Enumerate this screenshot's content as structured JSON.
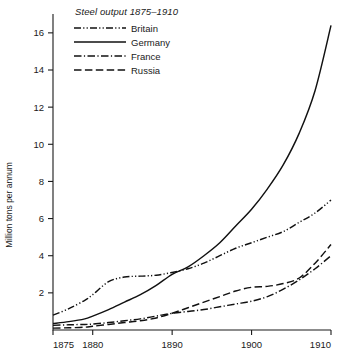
{
  "chart_data": {
    "type": "line",
    "title": "Steel output 1875–1910",
    "xlabel": "",
    "ylabel": "Million tons per annum",
    "xlim": [
      1875,
      1910
    ],
    "ylim": [
      0,
      16.8
    ],
    "grid": false,
    "legend_position": "top-left inside plot",
    "xticks": [
      1875,
      1880,
      1890,
      1900,
      1910
    ],
    "xtick_labels": [
      "1875",
      "1880",
      "1890",
      "1900",
      "1910"
    ],
    "yticks": [
      2,
      4,
      6,
      8,
      10,
      12,
      14,
      16
    ],
    "ytick_labels": [
      "2",
      "4",
      "6",
      "8",
      "10",
      "12",
      "14",
      "16"
    ],
    "series": [
      {
        "name": "Britain",
        "style": "dash-dot-dot",
        "x": [
          1875,
          1877,
          1879,
          1880,
          1882,
          1884,
          1886,
          1888,
          1890,
          1892,
          1894,
          1896,
          1898,
          1900,
          1902,
          1904,
          1906,
          1908,
          1910
        ],
        "values": [
          0.8,
          1.15,
          1.6,
          1.9,
          2.6,
          2.85,
          2.9,
          2.95,
          3.1,
          3.3,
          3.6,
          4.0,
          4.4,
          4.7,
          5.0,
          5.3,
          5.8,
          6.3,
          7.0
        ]
      },
      {
        "name": "Germany",
        "style": "solid",
        "x": [
          1875,
          1877,
          1879,
          1880,
          1882,
          1884,
          1886,
          1888,
          1890,
          1892,
          1894,
          1896,
          1898,
          1900,
          1902,
          1904,
          1906,
          1908,
          1910
        ],
        "values": [
          0.35,
          0.45,
          0.6,
          0.75,
          1.1,
          1.5,
          1.9,
          2.4,
          3.0,
          3.4,
          4.0,
          4.7,
          5.6,
          6.5,
          7.6,
          8.9,
          10.6,
          12.9,
          16.4
        ]
      },
      {
        "name": "France",
        "style": "dash-dot",
        "x": [
          1875,
          1877,
          1879,
          1880,
          1882,
          1884,
          1886,
          1888,
          1890,
          1892,
          1894,
          1896,
          1898,
          1900,
          1902,
          1904,
          1906,
          1908,
          1910
        ],
        "values": [
          0.25,
          0.28,
          0.3,
          0.32,
          0.4,
          0.5,
          0.6,
          0.75,
          0.9,
          1.0,
          1.1,
          1.25,
          1.4,
          1.55,
          1.8,
          2.2,
          2.7,
          3.3,
          4.0
        ]
      },
      {
        "name": "Russia",
        "style": "long-dash",
        "x": [
          1875,
          1877,
          1879,
          1880,
          1882,
          1884,
          1886,
          1888,
          1890,
          1892,
          1894,
          1896,
          1898,
          1900,
          1902,
          1904,
          1906,
          1908,
          1910
        ],
        "values": [
          0.1,
          0.12,
          0.15,
          0.2,
          0.3,
          0.4,
          0.5,
          0.65,
          0.9,
          1.2,
          1.5,
          1.8,
          2.1,
          2.3,
          2.35,
          2.5,
          2.8,
          3.6,
          4.6
        ]
      }
    ]
  },
  "legend": {
    "title": "Steel output 1875–1910",
    "entries": [
      {
        "label": "Britain",
        "style": "dash-dot-dot"
      },
      {
        "label": "Germany",
        "style": "solid"
      },
      {
        "label": "France",
        "style": "dash-dot"
      },
      {
        "label": "Russia",
        "style": "long-dash"
      }
    ]
  },
  "axes": {
    "y_title": "Million tons per annum"
  }
}
